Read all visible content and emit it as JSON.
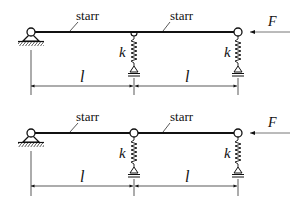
{
  "diagrams": [
    {
      "id": "top",
      "middle_connection": "continuous",
      "bar_labels": [
        "starr",
        "starr"
      ],
      "spring_labels": [
        "k",
        "k"
      ],
      "dimension_labels": [
        "l",
        "l"
      ],
      "force_label": "F"
    },
    {
      "id": "bottom",
      "middle_connection": "hinge",
      "bar_labels": [
        "starr",
        "starr"
      ],
      "spring_labels": [
        "k",
        "k"
      ],
      "dimension_labels": [
        "l",
        "l"
      ],
      "force_label": "F"
    }
  ],
  "colors": {
    "line": "#111111",
    "force_arrow": "#555555"
  }
}
